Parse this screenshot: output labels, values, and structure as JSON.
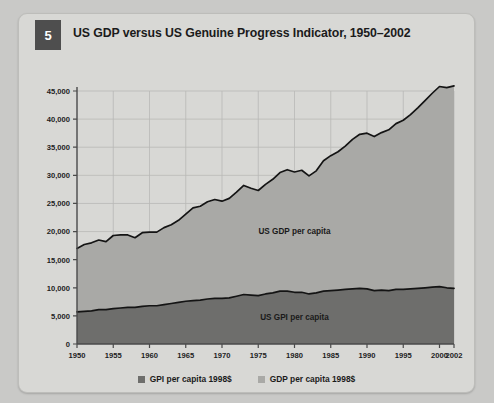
{
  "figure": {
    "number": "5",
    "title": "US GDP versus US Genuine Progress Indicator, 1950–2002"
  },
  "legend": {
    "items": [
      {
        "label": "GPI per capita 1998$",
        "color": "#6e6e6c"
      },
      {
        "label": "GDP per capita 1998$",
        "color": "#a9a9a6"
      }
    ]
  },
  "annotations": {
    "gdp_label": "US GDP per capita",
    "gpi_label": "US GPI per capita"
  },
  "colors": {
    "card_bg": "#d8d8d5",
    "page_bg": "#c9c9c7",
    "badge_bg": "#4e4e4e",
    "gdp_area": "#a9a9a6",
    "gpi_area": "#6e6e6c",
    "line": "#141414",
    "grid": "#b9b9b6",
    "axis": "#4a4a4a"
  },
  "chart_data": {
    "type": "area",
    "title": "US GDP versus US Genuine Progress Indicator, 1950–2002",
    "xlabel": "",
    "ylabel": "",
    "xlim": [
      1950,
      2002
    ],
    "ylim": [
      0,
      45000
    ],
    "grid": true,
    "legend_position": "bottom",
    "xticks": [
      1950,
      1955,
      1960,
      1965,
      1970,
      1975,
      1980,
      1985,
      1990,
      1995,
      2000,
      2002
    ],
    "xtick_labels": [
      "1950",
      "1955",
      "1960",
      "1965",
      "1970",
      "1975",
      "1980",
      "1985",
      "1990",
      "1995",
      "2000",
      "2002"
    ],
    "yticks": [
      0,
      5000,
      10000,
      15000,
      20000,
      25000,
      30000,
      35000,
      40000,
      45000
    ],
    "ytick_labels": [
      "0",
      "5,000",
      "10,000",
      "15,000",
      "20,000",
      "25,000",
      "30,000",
      "35,000",
      "40,000",
      "45,000"
    ],
    "x": [
      1950,
      1951,
      1952,
      1953,
      1954,
      1955,
      1956,
      1957,
      1958,
      1959,
      1960,
      1961,
      1962,
      1963,
      1964,
      1965,
      1966,
      1967,
      1968,
      1969,
      1970,
      1971,
      1972,
      1973,
      1974,
      1975,
      1976,
      1977,
      1978,
      1979,
      1980,
      1981,
      1982,
      1983,
      1984,
      1985,
      1986,
      1987,
      1988,
      1989,
      1990,
      1991,
      1992,
      1993,
      1994,
      1995,
      1996,
      1997,
      1998,
      1999,
      2000,
      2001,
      2002
    ],
    "series": [
      {
        "name": "GDP per capita 1998$",
        "label": "US GDP per capita",
        "units": "1998 US$ per capita",
        "color": "#a9a9a6",
        "values": [
          17000,
          17700,
          18000,
          18500,
          18200,
          19300,
          19400,
          19400,
          18900,
          19800,
          19900,
          19900,
          20700,
          21200,
          22000,
          23100,
          24200,
          24500,
          25300,
          25700,
          25400,
          25900,
          27000,
          28200,
          27700,
          27300,
          28400,
          29300,
          30500,
          31000,
          30600,
          30900,
          29900,
          30800,
          32600,
          33500,
          34200,
          35200,
          36400,
          37300,
          37500,
          36900,
          37600,
          38100,
          39200,
          39800,
          40800,
          42000,
          43300,
          44600,
          45800,
          45600,
          45900
        ],
        "scaled_note": "values plotted on axis 0–45,000; curve peaks near 42,000"
      },
      {
        "name": "GPI per capita 1998$",
        "label": "US GPI per capita",
        "units": "1998 US$ per capita",
        "color": "#6e6e6c",
        "values": [
          5700,
          5800,
          5900,
          6100,
          6100,
          6300,
          6400,
          6500,
          6500,
          6700,
          6800,
          6800,
          7000,
          7200,
          7400,
          7600,
          7700,
          7800,
          8000,
          8100,
          8100,
          8200,
          8500,
          8800,
          8700,
          8600,
          8900,
          9100,
          9400,
          9400,
          9200,
          9200,
          8900,
          9100,
          9400,
          9500,
          9600,
          9700,
          9800,
          9900,
          9800,
          9500,
          9600,
          9500,
          9700,
          9700,
          9800,
          9900,
          10000,
          10100,
          10200,
          10000,
          9900
        ]
      }
    ]
  }
}
